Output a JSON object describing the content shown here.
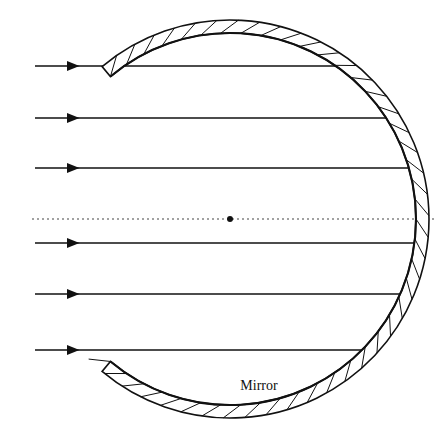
{
  "figure": {
    "title_label": "Mirror",
    "background_color": "#ffffff",
    "ink_color": "#111111",
    "axis_color": "#444444"
  },
  "geometry": {
    "canvas_width": 448,
    "canvas_height": 447,
    "center_of_curvature": {
      "x": 230,
      "y": 219,
      "radius_px": 3
    },
    "mirror": {
      "inner_radius": 186,
      "outer_radius": 199,
      "thickness": 13,
      "start_angle_deg": -130,
      "end_angle_deg": 130,
      "hatch_count": 42,
      "vertex_x": 416
    },
    "optical_axis": {
      "y": 219,
      "x_start": 32,
      "x_end": 436,
      "dash_on": 2,
      "dash_off": 3
    },
    "rays": {
      "x_start": 35,
      "arrow_x": 75,
      "arrow_size": 5,
      "y_values": [
        66,
        118,
        168,
        243,
        294,
        350
      ]
    },
    "label_position": {
      "x": 259,
      "y": 390
    }
  },
  "chart_data": {
    "type": "diagram",
    "elements": [
      {
        "name": "incident-ray-1",
        "y": 66,
        "direction": "left-to-right"
      },
      {
        "name": "incident-ray-2",
        "y": 118,
        "direction": "left-to-right"
      },
      {
        "name": "incident-ray-3",
        "y": 168,
        "direction": "left-to-right"
      },
      {
        "name": "incident-ray-4",
        "y": 243,
        "direction": "left-to-right"
      },
      {
        "name": "incident-ray-5",
        "y": 294,
        "direction": "left-to-right"
      },
      {
        "name": "incident-ray-6",
        "y": 350,
        "direction": "left-to-right"
      },
      {
        "name": "optical-axis",
        "y": 219,
        "style": "dashed"
      },
      {
        "name": "center-of-curvature",
        "x": 230,
        "y": 219,
        "style": "filled-dot"
      },
      {
        "name": "mirror-arc",
        "style": "hatched-thick-arc"
      }
    ],
    "labels": [
      "Mirror"
    ]
  }
}
